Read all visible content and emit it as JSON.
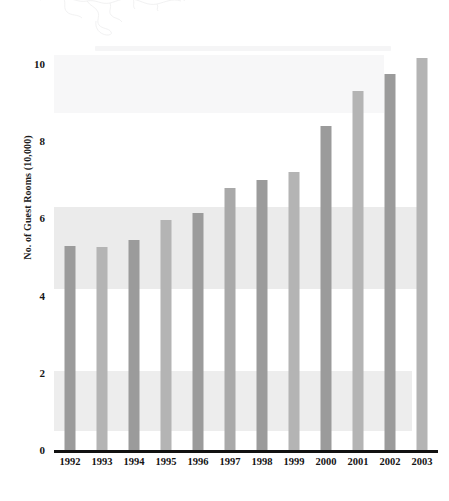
{
  "chart_data": {
    "type": "bar",
    "title": "",
    "xlabel": "",
    "ylabel": "No. of Guest Rooms (10,000)",
    "categories": [
      "1992",
      "1993",
      "1994",
      "1995",
      "1996",
      "1997",
      "1998",
      "1999",
      "2000",
      "2001",
      "2002",
      "2003"
    ],
    "values": [
      5.3,
      5.25,
      5.45,
      5.95,
      6.15,
      6.8,
      7.0,
      7.2,
      8.4,
      9.3,
      9.75,
      10.15
    ],
    "ylim": [
      0,
      10.6
    ],
    "yticks": [
      "0",
      "2",
      "4",
      "6",
      "8",
      "10"
    ],
    "ytick_values": [
      0,
      2,
      4,
      6,
      8,
      10
    ],
    "grid": false,
    "legend": "none",
    "bar_colors": [
      "#9b9b9b",
      "#b4b4b4",
      "#9b9b9b",
      "#b4b4b4",
      "#9b9b9b",
      "#a9a9a9",
      "#9b9b9b",
      "#b4b4b4",
      "#9b9b9b",
      "#b4b4b4",
      "#9b9b9b",
      "#b4b4b4"
    ]
  },
  "figure": {
    "axis_color": "#111111",
    "background": "#ffffff",
    "text_color": "#161616"
  }
}
